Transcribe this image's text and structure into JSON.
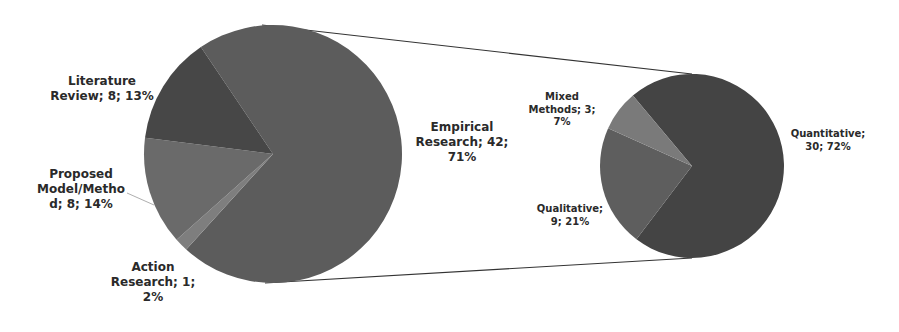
{
  "chart_data": {
    "type": "pie",
    "subtype": "pie-of-pie",
    "title": "",
    "main_pie": {
      "slices": [
        {
          "label": "Empirical Research",
          "value": 42,
          "percent": 71,
          "color": "#5c5c5c"
        },
        {
          "label": "Literature Review",
          "value": 8,
          "percent": 13,
          "color": "#474747"
        },
        {
          "label": "Proposed Model/Method",
          "value": 8,
          "percent": 14,
          "color": "#6a6a6a"
        },
        {
          "label": "Action Research",
          "value": 1,
          "percent": 2,
          "color": "#7e7e7e"
        }
      ]
    },
    "secondary_pie": {
      "breakdown_of": "Empirical Research",
      "slices": [
        {
          "label": "Quantitative",
          "value": 30,
          "percent": 72,
          "color": "#444444"
        },
        {
          "label": "Qualitative",
          "value": 9,
          "percent": 21,
          "color": "#5e5e5e"
        },
        {
          "label": "Mixed Methods",
          "value": 3,
          "percent": 7,
          "color": "#7a7a7a"
        }
      ]
    },
    "legend": "none (data labels: Category; Value; Percent)"
  },
  "labels": {
    "literature": [
      "Literature",
      "Review; 8; 13%"
    ],
    "proposed": [
      "Proposed",
      "Model/Metho",
      "d; 8; 14%"
    ],
    "action": [
      "Action",
      "Research; 1;",
      "2%"
    ],
    "empirical": [
      "Empirical",
      "Research; 42;",
      "71%"
    ],
    "mixed": [
      "Mixed",
      "Methods; 3;",
      "7%"
    ],
    "qualitative": [
      "Qualitative;",
      "9; 21%"
    ],
    "quantitative": [
      "Quantitative;",
      "30; 72%"
    ]
  }
}
